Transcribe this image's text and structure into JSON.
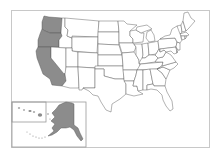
{
  "map": {
    "type": "US states locator map",
    "colors": {
      "highlight": "#8c8c8c",
      "default": "#ffffff",
      "stroke": "#555555",
      "frame": "#c8c8c8"
    },
    "highlighted_states": [
      "Washington",
      "Oregon",
      "California"
    ],
    "insets": [
      {
        "name": "Hawaii",
        "highlighted": false
      },
      {
        "name": "Alaska",
        "highlighted": true
      }
    ]
  }
}
